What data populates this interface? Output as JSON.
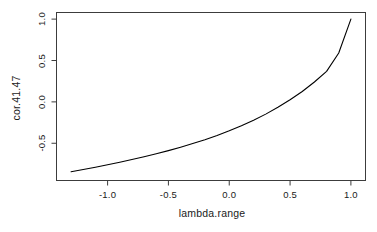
{
  "chart_data": {
    "type": "line",
    "title": "",
    "xlabel": "lambda.range",
    "ylabel": "cor.41.47",
    "xlim": [
      -1.42,
      1.12
    ],
    "ylim": [
      -0.95,
      1.08
    ],
    "xticks": [
      "-1.0",
      "-0.5",
      "0.0",
      "0.5",
      "1.0"
    ],
    "xtick_values": [
      -1.0,
      -0.5,
      0.0,
      0.5,
      1.0
    ],
    "yticks": [
      "1.0",
      "0.5",
      "0.0",
      "-0.5"
    ],
    "ytick_values": [
      1.0,
      0.5,
      0.0,
      -0.5
    ],
    "grid": false,
    "legend": "none",
    "box": "full",
    "series": [
      {
        "name": "cor.41.47",
        "color": "#000000",
        "x": [
          -1.3,
          -1.2,
          -1.1,
          -1.0,
          -0.9,
          -0.8,
          -0.7,
          -0.6,
          -0.5,
          -0.4,
          -0.3,
          -0.2,
          -0.1,
          0.0,
          0.1,
          0.2,
          0.3,
          0.4,
          0.5,
          0.6,
          0.7,
          0.8,
          0.9,
          1.0
        ],
        "y": [
          -0.845,
          -0.818,
          -0.789,
          -0.76,
          -0.729,
          -0.697,
          -0.663,
          -0.627,
          -0.589,
          -0.548,
          -0.504,
          -0.457,
          -0.406,
          -0.35,
          -0.289,
          -0.222,
          -0.148,
          -0.066,
          0.025,
          0.126,
          0.24,
          0.369,
          0.59,
          1.0
        ]
      }
    ]
  },
  "axis_labels": {
    "x_title": "lambda.range",
    "y_title": "cor.41.47"
  }
}
